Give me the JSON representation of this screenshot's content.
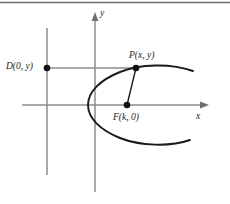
{
  "figure": {
    "kind": "geometry-diagram",
    "colors": {
      "curve": "#1a1a1a",
      "axis": "#8c8c8c",
      "directrix": "#8c8c8c",
      "connector_gray": "#8c8c8c",
      "connector_black": "#1a1a1a",
      "point_fill": "#111111",
      "rule": "#6e6e6e",
      "background": "#ffffff"
    },
    "top_rule": true,
    "axes": {
      "x_label": "x",
      "y_label": "y",
      "origin": {
        "x": 95,
        "y": 105
      },
      "x_axis": {
        "from_x": 22,
        "to_x": 208,
        "y": 105,
        "arrow": "right"
      },
      "y_axis": {
        "x": 95,
        "from_y": 192,
        "to_y": 16,
        "arrow": "up"
      }
    },
    "directrix": {
      "name": "directrix",
      "x": 47,
      "from_y": 28,
      "to_y": 175
    },
    "points": [
      {
        "id": "D",
        "label": "D(0, y)",
        "x": 47,
        "y": 68,
        "label_position": "left"
      },
      {
        "id": "P",
        "label": "P(x, y)",
        "x": 136,
        "y": 68,
        "label_position": "above"
      },
      {
        "id": "F",
        "label": "F(k, 0)",
        "x": 127,
        "y": 105,
        "label_position": "below"
      }
    ],
    "segments": [
      {
        "id": "D-to-P",
        "from": "D",
        "to": "P",
        "color": "#8c8c8c"
      },
      {
        "id": "P-to-F",
        "from": "P",
        "to": "F",
        "color": "#1a1a1a"
      }
    ],
    "curve": {
      "id": "parabola",
      "opens": "right",
      "vertex": {
        "x": 95,
        "y": 105
      }
    }
  }
}
